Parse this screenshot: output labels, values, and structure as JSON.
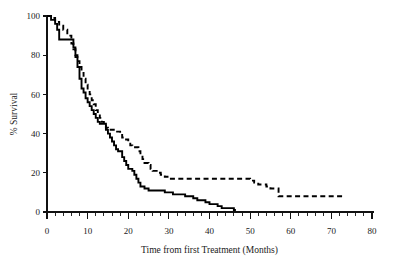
{
  "chart_data": {
    "type": "line",
    "title": "",
    "subtitle": "",
    "xlabel": "Time from first Treatment (Months)",
    "ylabel": "% Survival",
    "xlim": [
      0,
      80
    ],
    "ylim": [
      0,
      100
    ],
    "x_ticks": [
      0,
      10,
      20,
      30,
      40,
      50,
      60,
      70,
      80
    ],
    "x_tick_labels": [
      "0",
      "10",
      "20",
      "30",
      "40",
      "50",
      "60",
      "70",
      "80"
    ],
    "x_minor_tick_step": 2,
    "y_ticks": [
      0,
      20,
      40,
      60,
      80,
      100
    ],
    "y_tick_labels": [
      "0",
      "20",
      "40",
      "60",
      "80",
      "100"
    ],
    "grid": false,
    "legend": "none",
    "annotations": [],
    "series": [
      {
        "name": "solid-curve",
        "style": "solid",
        "color": "#000000",
        "step": "post",
        "points": [
          [
            0,
            100
          ],
          [
            1,
            98
          ],
          [
            2,
            96
          ],
          [
            2.5,
            93
          ],
          [
            3,
            88
          ],
          [
            6,
            88
          ],
          [
            6.5,
            84
          ],
          [
            7,
            79
          ],
          [
            7.5,
            74
          ],
          [
            8,
            68
          ],
          [
            8.5,
            63
          ],
          [
            9,
            61
          ],
          [
            9.5,
            58
          ],
          [
            10,
            56
          ],
          [
            10.5,
            54
          ],
          [
            11,
            52
          ],
          [
            11.5,
            50
          ],
          [
            12,
            48
          ],
          [
            12.5,
            46
          ],
          [
            13,
            45
          ],
          [
            14,
            45
          ],
          [
            14.5,
            42
          ],
          [
            15,
            40
          ],
          [
            15.5,
            38
          ],
          [
            16,
            36
          ],
          [
            16.5,
            34
          ],
          [
            17,
            32
          ],
          [
            17.5,
            31
          ],
          [
            18,
            31
          ],
          [
            18.5,
            28
          ],
          [
            19,
            26
          ],
          [
            19.5,
            24
          ],
          [
            20,
            22
          ],
          [
            21,
            21
          ],
          [
            21.5,
            19
          ],
          [
            22,
            17
          ],
          [
            22.5,
            15
          ],
          [
            23,
            13
          ],
          [
            24,
            12
          ],
          [
            25,
            11
          ],
          [
            26,
            11
          ],
          [
            28,
            11
          ],
          [
            29,
            10
          ],
          [
            30,
            10
          ],
          [
            31,
            9
          ],
          [
            33,
            9
          ],
          [
            34,
            8
          ],
          [
            35,
            8
          ],
          [
            36,
            7
          ],
          [
            37,
            6
          ],
          [
            38,
            6
          ],
          [
            39,
            5
          ],
          [
            40,
            4
          ],
          [
            41,
            4
          ],
          [
            42,
            3
          ],
          [
            43,
            2
          ],
          [
            44,
            2
          ],
          [
            45,
            2
          ],
          [
            46,
            1
          ],
          [
            46.5,
            1
          ]
        ]
      },
      {
        "name": "dashed-curve",
        "style": "dashed",
        "color": "#000000",
        "step": "post",
        "points": [
          [
            0,
            100
          ],
          [
            1,
            99
          ],
          [
            2,
            97
          ],
          [
            3,
            95
          ],
          [
            4,
            93
          ],
          [
            5,
            90
          ],
          [
            6,
            86
          ],
          [
            6.5,
            83
          ],
          [
            7,
            80
          ],
          [
            7.5,
            77
          ],
          [
            8,
            74
          ],
          [
            8.5,
            71
          ],
          [
            9,
            68
          ],
          [
            9.5,
            65
          ],
          [
            10,
            62
          ],
          [
            10.5,
            60
          ],
          [
            11,
            57
          ],
          [
            11.5,
            55
          ],
          [
            12,
            52
          ],
          [
            12.5,
            50
          ],
          [
            13,
            48
          ],
          [
            13.5,
            46
          ],
          [
            14,
            44
          ],
          [
            14.5,
            43
          ],
          [
            15,
            42
          ],
          [
            16,
            42
          ],
          [
            17,
            41
          ],
          [
            18,
            40
          ],
          [
            18.5,
            38
          ],
          [
            19,
            37
          ],
          [
            20,
            36
          ],
          [
            20.5,
            34
          ],
          [
            21,
            33
          ],
          [
            22,
            33
          ],
          [
            22.5,
            31
          ],
          [
            23,
            29
          ],
          [
            23.5,
            27
          ],
          [
            24,
            25
          ],
          [
            25,
            24
          ],
          [
            25.5,
            22
          ],
          [
            26,
            21
          ],
          [
            27,
            20
          ],
          [
            28,
            19
          ],
          [
            29,
            18
          ],
          [
            30,
            17
          ],
          [
            31,
            17
          ],
          [
            40,
            17
          ],
          [
            45,
            17
          ],
          [
            49,
            17
          ],
          [
            50,
            16
          ],
          [
            51,
            15
          ],
          [
            52,
            14
          ],
          [
            53,
            14
          ],
          [
            54,
            13
          ],
          [
            55,
            12
          ],
          [
            56,
            12
          ],
          [
            57,
            8
          ],
          [
            60,
            8
          ],
          [
            65,
            8
          ],
          [
            70,
            8
          ],
          [
            73,
            8
          ]
        ]
      }
    ]
  }
}
